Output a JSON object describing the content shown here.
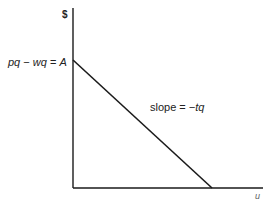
{
  "diagram": {
    "y_axis_label": "$",
    "x_axis_label": "u",
    "intercept_label": {
      "p": "pq",
      "minus": " − ",
      "w": "wq",
      "equals": " = ",
      "a": "A"
    },
    "slope_label": {
      "text": "slope = ",
      "value": "−tq"
    },
    "colors": {
      "line": "#1a1a1a",
      "axis": "#1a1a1a",
      "background": "#ffffff"
    },
    "geometry": {
      "y_axis": {
        "x": 73,
        "y_top": 8,
        "y_bottom": 188
      },
      "x_axis": {
        "y": 188,
        "x_left": 73,
        "x_right": 263
      },
      "budget_line": {
        "x1": 73,
        "y1": 60,
        "x2": 212,
        "y2": 188
      }
    }
  }
}
